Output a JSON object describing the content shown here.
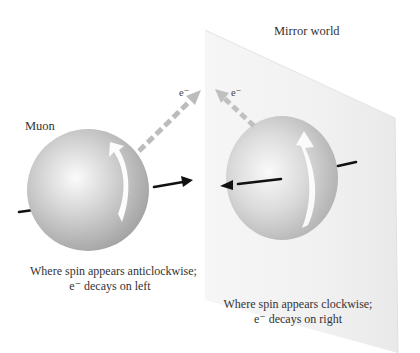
{
  "diagram": {
    "title_left": "Muon",
    "title_right": "Mirror world",
    "left": {
      "electron_label": "e⁻",
      "caption_line1": "Where spin appears anticlockwise;",
      "caption_line2": "e⁻ decays on left"
    },
    "right": {
      "electron_label": "e⁻",
      "caption_line1": "Where spin appears clockwise;",
      "caption_line2": "e⁻ decays on right"
    },
    "colors": {
      "sphere": "#bdbdbd",
      "sphere_highlight": "#f6f6f6",
      "mirror_plane": "#eeeeee",
      "electron_arrow": "#b8b8b8",
      "spin_axis": "#111111",
      "spin_arrow": "#ffffff"
    }
  }
}
